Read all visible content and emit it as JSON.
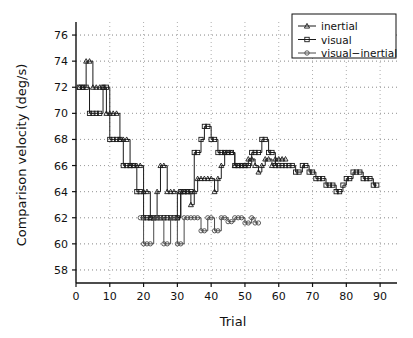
{
  "chart_data": {
    "type": "line",
    "title": "",
    "xlabel": "Trial",
    "ylabel": "Comparison velocity (deg/s)",
    "xlim": [
      0,
      95
    ],
    "ylim": [
      57,
      77
    ],
    "xticks": [
      0,
      10,
      20,
      30,
      40,
      50,
      60,
      70,
      80,
      90
    ],
    "yticks": [
      58,
      60,
      62,
      64,
      66,
      68,
      70,
      72,
      74,
      76
    ],
    "grid": "dotted-horizontal-and-vertical",
    "legend_position": "top-right",
    "series": [
      {
        "name": "inertial",
        "marker": "triangle",
        "color": "#1a1a1a",
        "x": [
          1,
          2,
          3,
          4,
          5,
          6,
          7,
          8,
          9,
          10,
          11,
          12,
          13,
          14,
          15,
          16,
          17,
          18,
          19,
          20,
          21,
          22,
          23,
          24,
          25,
          26,
          27,
          28,
          29,
          30,
          31,
          32,
          33,
          34,
          35,
          36,
          37,
          38,
          39,
          40,
          41,
          42,
          43,
          44,
          45,
          46,
          47,
          48,
          49,
          50,
          51,
          52,
          53,
          54,
          55,
          56,
          57,
          58,
          59,
          60,
          61,
          62
        ],
        "values": [
          72,
          72,
          74,
          74,
          72,
          72,
          72,
          72,
          70,
          70,
          70,
          70,
          68,
          68,
          68,
          66,
          66,
          66,
          66,
          64,
          64,
          62,
          62,
          64,
          66,
          66,
          64,
          64,
          64,
          62,
          64,
          64,
          64,
          63,
          64,
          65,
          65,
          65,
          65,
          65,
          64,
          65,
          66,
          67,
          67,
          67,
          66,
          66,
          66,
          66,
          66.5,
          66.5,
          66,
          65.5,
          66,
          66.5,
          66.5,
          66,
          66.5,
          66.5,
          66.5,
          66.5
        ]
      },
      {
        "name": "visual",
        "marker": "square",
        "color": "#1a1a1a",
        "x": [
          1,
          2,
          3,
          4,
          5,
          6,
          7,
          8,
          9,
          10,
          11,
          12,
          13,
          14,
          15,
          16,
          17,
          18,
          19,
          20,
          21,
          22,
          23,
          24,
          25,
          26,
          27,
          28,
          29,
          30,
          31,
          32,
          33,
          34,
          35,
          36,
          37,
          38,
          39,
          40,
          41,
          42,
          43,
          44,
          45,
          46,
          47,
          48,
          49,
          50,
          51,
          52,
          53,
          54,
          55,
          56,
          57,
          58,
          59,
          60,
          61,
          62,
          63,
          64,
          65,
          66,
          67,
          68,
          69,
          70,
          71,
          72,
          73,
          74,
          75,
          76,
          77,
          78,
          79,
          80,
          81,
          82,
          83,
          84,
          85,
          86,
          87,
          88,
          89
        ],
        "values": [
          72,
          72,
          72,
          70,
          70,
          70,
          70,
          72,
          72,
          68,
          68,
          68,
          68,
          66,
          66,
          66,
          66,
          64,
          64,
          62,
          62,
          62,
          62,
          62,
          62,
          62,
          62,
          62,
          62,
          62,
          64,
          64,
          64,
          64,
          67,
          67,
          68,
          69,
          69,
          68,
          68,
          67,
          67,
          67,
          67,
          67,
          66,
          66,
          66,
          66,
          66,
          67,
          67,
          67,
          68,
          68,
          67,
          67,
          66,
          66,
          66,
          66,
          66,
          66,
          65.5,
          65.5,
          66,
          66,
          65.5,
          65.5,
          65,
          65,
          65,
          64.5,
          64.5,
          64.5,
          64,
          64,
          64.5,
          65,
          65,
          65.5,
          65.5,
          65.5,
          65,
          65,
          65,
          64.5,
          64.5
        ]
      },
      {
        "name": "visual−inertial",
        "marker": "circle",
        "color": "#4a4a4a",
        "x": [
          19,
          20,
          21,
          22,
          23,
          24,
          25,
          26,
          27,
          28,
          29,
          30,
          31,
          32,
          33,
          34,
          35,
          36,
          37,
          38,
          39,
          40,
          41,
          42,
          43,
          44,
          45,
          46,
          47,
          48,
          49,
          50,
          51,
          52,
          53,
          54
        ],
        "values": [
          62,
          60,
          60,
          60,
          62,
          62,
          62,
          60,
          60,
          62,
          62,
          60,
          60,
          62,
          62,
          62,
          62,
          62,
          61,
          61,
          62,
          62,
          61,
          61,
          62,
          62,
          61.7,
          61.7,
          62,
          62,
          62,
          61.6,
          61.6,
          62,
          61.6,
          61.6
        ]
      }
    ]
  },
  "legend": {
    "items": [
      {
        "label": "inertial",
        "marker": "triangle"
      },
      {
        "label": "visual",
        "marker": "square"
      },
      {
        "label": "visual−inertial",
        "marker": "circle"
      }
    ]
  },
  "axes": {
    "x_title": "Trial",
    "y_title": "Comparison velocity (deg/s)",
    "x_tick_labels": [
      "0",
      "10",
      "20",
      "30",
      "40",
      "50",
      "60",
      "70",
      "80",
      "90"
    ],
    "y_tick_labels": [
      "58",
      "60",
      "62",
      "64",
      "66",
      "68",
      "70",
      "72",
      "74",
      "76"
    ]
  },
  "colors": {
    "background": "#ffffff",
    "axis": "#111111",
    "grid": "#9a9a9a",
    "series_dark": "#1a1a1a",
    "series_gray": "#4a4a4a"
  }
}
